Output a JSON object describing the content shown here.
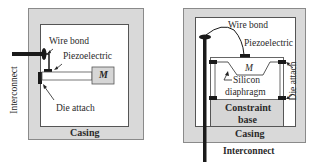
{
  "left_diagram": {
    "name": "cantilever piezoelectric sensor",
    "labels": {
      "wire_bond": "Wire bond",
      "piezoelectric": "Piezoelectric",
      "mass": "M",
      "die_attach": "Die attach",
      "interconnect": "Interconnect",
      "casing": "Casing"
    }
  },
  "right_diagram": {
    "name": "diaphragm piezoelectric sensor",
    "labels": {
      "wire_bond": "Wire bond",
      "piezoelectric": "Piezoelectric",
      "mass": "M",
      "silicon_diaphragm_line1": "Silicon",
      "silicon_diaphragm_line2": "diaphragm",
      "die_attach": "Die attach",
      "constraint_base_line1": "Constraint",
      "constraint_base_line2": "base",
      "casing": "Casing",
      "interconnect": "Interconnect"
    }
  },
  "colors": {
    "casing_fill": "#d9d9d9",
    "mass_fill": "#d6d6d6",
    "dark_part": "#1a1a1a",
    "line": "#444444"
  }
}
